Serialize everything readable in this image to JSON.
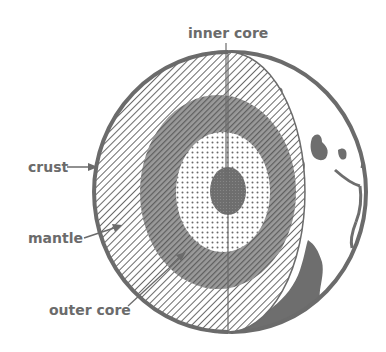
{
  "diagram": {
    "labels": {
      "inner_core": "inner core",
      "crust": "crust",
      "mantle": "mantle",
      "outer_core": "outer core"
    },
    "colors": {
      "ink": "#6b6b6b",
      "background": "#ffffff",
      "fill_dark": "#707070"
    },
    "layers": [
      {
        "name": "crust",
        "pattern": "outline"
      },
      {
        "name": "mantle",
        "pattern": "light-diagonal-hatch"
      },
      {
        "name": "outer core",
        "pattern": "dense-diagonal-hatch"
      },
      {
        "name": "inner core (outer zone)",
        "pattern": "dots"
      },
      {
        "name": "inner core (center)",
        "pattern": "dark-dots"
      }
    ]
  }
}
